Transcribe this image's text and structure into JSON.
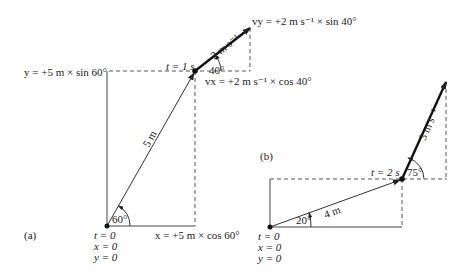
{
  "panel_a": {
    "label": "(a)",
    "origin_t": "t = 0",
    "origin_x": "x = 0",
    "origin_y": "y = 0",
    "displacement": "5 m",
    "angle_origin": "60°",
    "y_component": "y = +5 m × sin 60°",
    "x_component": "x = +5 m × cos 60°",
    "time_point": "t = 1 s",
    "velocity": "2 m s⁻¹",
    "angle_velocity": "40°",
    "vy_component": "vy = +2 m s⁻¹ × sin 40°",
    "vx_component": "vx = +2 m s⁻¹ × cos 40°"
  },
  "panel_b": {
    "label": "(b)",
    "origin_t": "t = 0",
    "origin_x": "x = 0",
    "origin_y": "y = 0",
    "displacement": "4 m",
    "angle_origin": "20°",
    "time_point": "t = 2 s",
    "velocity": "3 m s⁻¹",
    "angle_velocity": "75°"
  },
  "colors": {
    "ink": "#222222",
    "dash": "#555555"
  }
}
